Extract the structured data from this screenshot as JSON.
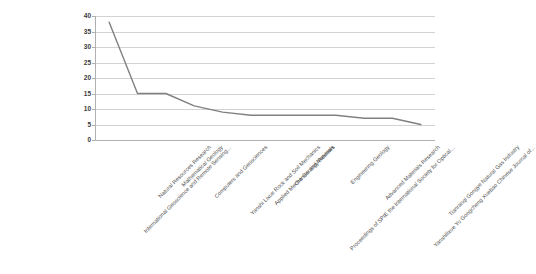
{
  "chart_data": {
    "type": "line",
    "title": "",
    "subtitle": "",
    "xlabel": "",
    "ylabel": "",
    "ylim": [
      0,
      40
    ],
    "yticks": [
      0,
      5,
      10,
      15,
      20,
      25,
      30,
      35,
      40
    ],
    "grid": true,
    "legend": false,
    "legend_position": "none",
    "line_color": "#808080",
    "gridline_color": "#d3d3d3",
    "axis_color": "#b0b0b0",
    "categories": [
      "International Geoscience and Remote Sensing…",
      "Natural Resources Research",
      "Mathematical Geology",
      "Computers and Geosciences",
      "Yanshi Lixue Rock and Soil Mechanics",
      "Applied Mechanics and Materials",
      "Ore Geology Reviews",
      "Proceedings of SPIE the International Society for Optical…",
      "Engineering Geology",
      "Advanced Materials Research",
      "Yanshilixue Yu Gongcheng Xuebao Chinese Journal of…",
      "Tianranqi Gongye Natural Gas Industry"
    ],
    "values": [
      38,
      15,
      15,
      11,
      9,
      8,
      8,
      8,
      8,
      7,
      7,
      5
    ],
    "series": [
      {
        "name": "Publications",
        "values": [
          38,
          15,
          15,
          11,
          9,
          8,
          8,
          8,
          8,
          7,
          7,
          5
        ]
      }
    ]
  },
  "axis": {
    "y_tick_labels": [
      "40",
      "35",
      "30",
      "25",
      "20",
      "15",
      "10",
      "5",
      "0"
    ]
  }
}
